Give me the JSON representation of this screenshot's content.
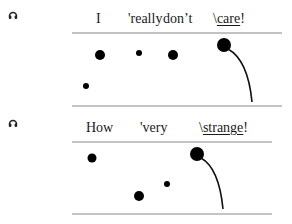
{
  "examples": [
    {
      "audio_icon": "headphones-icon",
      "words": [
        {
          "text": "I",
          "x": 96,
          "stressed": false
        },
        {
          "text": "'really",
          "x": 128,
          "stressed": false
        },
        {
          "text": "don’t",
          "x": 163,
          "stressed": false
        },
        {
          "prefix": "\\",
          "text": "care",
          "suffix": "!",
          "x": 213,
          "stressed": true
        }
      ],
      "pitch_lines": {
        "top_y": 33,
        "bottom_y": 106,
        "x1": 72,
        "x2": 282
      },
      "dots": [
        {
          "cx": 100,
          "cy": 55,
          "r": 5
        },
        {
          "cx": 139,
          "cy": 53,
          "r": 3
        },
        {
          "cx": 173,
          "cy": 55,
          "r": 5
        },
        {
          "cx": 86,
          "cy": 86,
          "r": 3
        },
        {
          "cx": 224,
          "cy": 45,
          "r": 7
        }
      ],
      "fall_curve": {
        "from": [
          228,
          49
        ],
        "ctrl": [
          248,
          60
        ],
        "to": [
          252,
          102
        ]
      }
    },
    {
      "audio_icon": "headphones-icon",
      "words": [
        {
          "text": "How",
          "x": 86,
          "stressed": false
        },
        {
          "text": "'very",
          "x": 140,
          "stressed": false
        },
        {
          "prefix": "\\",
          "text": "strange",
          "suffix": "!",
          "x": 199,
          "stressed": true
        }
      ],
      "pitch_lines": {
        "top_y": 142,
        "bottom_y": 214,
        "x1": 72,
        "x2": 272
      },
      "dots": [
        {
          "cx": 92,
          "cy": 158,
          "r": 4.5
        },
        {
          "cx": 139,
          "cy": 196,
          "r": 5
        },
        {
          "cx": 167,
          "cy": 184,
          "r": 3
        },
        {
          "cx": 197,
          "cy": 154,
          "r": 7
        }
      ],
      "fall_curve": {
        "from": [
          201,
          158
        ],
        "ctrl": [
          219,
          168
        ],
        "to": [
          223,
          209
        ]
      }
    }
  ]
}
